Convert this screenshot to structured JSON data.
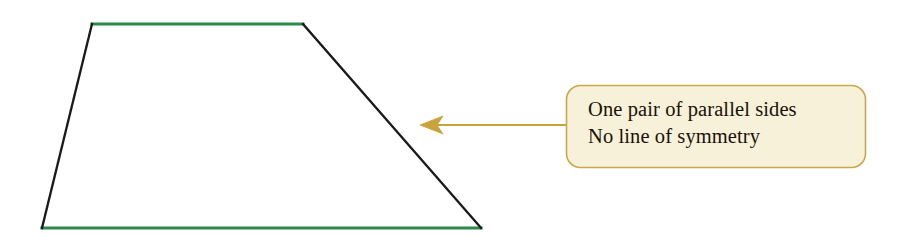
{
  "canvas": {
    "width": 902,
    "height": 237,
    "background": "#ffffff"
  },
  "figure": {
    "name": "trapezium",
    "shape_type": "trapezium",
    "parallel_side_color": "#2a8a4a",
    "leg_color": "#1a1a1a",
    "fill": "none",
    "stroke_width": 2.2,
    "vertices": {
      "top_left": {
        "x": 92,
        "y": 24
      },
      "top_right": {
        "x": 303,
        "y": 24
      },
      "bottom_right": {
        "x": 481,
        "y": 228
      },
      "bottom_left": {
        "x": 42,
        "y": 228
      }
    },
    "sides": [
      {
        "name": "top-side",
        "from": "top_left",
        "to": "top_right",
        "color": "#2a8a4a",
        "parallel": true
      },
      {
        "name": "right-leg",
        "from": "top_right",
        "to": "bottom_right",
        "color": "#1a1a1a",
        "parallel": false
      },
      {
        "name": "bottom-side",
        "from": "bottom_right",
        "to": "bottom_left",
        "color": "#2a8a4a",
        "parallel": true
      },
      {
        "name": "left-leg",
        "from": "bottom_left",
        "to": "top_left",
        "color": "#1a1a1a",
        "parallel": false
      }
    ]
  },
  "annotation": {
    "arrow": {
      "color": "#c8a23a",
      "tip": {
        "x": 420,
        "y": 125
      },
      "tail": {
        "x": 566,
        "y": 125
      },
      "direction": "left"
    },
    "callout": {
      "x": 566,
      "y": 85,
      "width": 300,
      "height": 83,
      "fill": "#f7f1d9",
      "border_color": "#c9a84a",
      "corner_radius": 14,
      "lines": [
        "One pair of parallel sides",
        "No line of symmetry"
      ]
    }
  }
}
